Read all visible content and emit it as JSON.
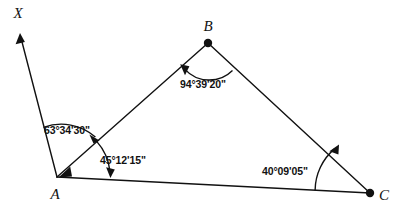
{
  "figure": {
    "type": "geometry-diagram",
    "shape": "triangle-with-ray",
    "background_color": "#ffffff",
    "stroke_color": "#111111",
    "vertices": [
      {
        "id": "A",
        "label": "A",
        "x": 57,
        "y": 177,
        "dot": false,
        "label_x": 55,
        "label_y": 199
      },
      {
        "id": "B",
        "label": "B",
        "x": 208,
        "y": 43,
        "dot": true,
        "label_x": 208,
        "label_y": 31
      },
      {
        "id": "C",
        "label": "C",
        "x": 370,
        "y": 193,
        "dot": true,
        "label_x": 384,
        "label_y": 200
      },
      {
        "id": "X",
        "label": "X",
        "x": 20,
        "y": 38,
        "dot": false,
        "label_x": 18,
        "label_y": 18
      }
    ],
    "segments": [
      {
        "name": "ray-A-X",
        "from": "A",
        "to": "X",
        "arrow_at_end": true
      },
      {
        "name": "side-A-B",
        "from": "A",
        "to": "B",
        "arrow_at_end": false
      },
      {
        "name": "side-B-C",
        "from": "B",
        "to": "C",
        "arrow_at_end": false
      },
      {
        "name": "side-A-C",
        "from": "A",
        "to": "C",
        "arrow_at_end": false
      }
    ],
    "angles": [
      {
        "id": "angle-XAB",
        "vertex": "A",
        "value": "63°34'30\"",
        "label_x": 44,
        "label_y": 134,
        "arc_radius": 52,
        "arrow": "at-end"
      },
      {
        "id": "angle-BAC",
        "vertex": "A",
        "value": "45°12'15\"",
        "label_x": 100,
        "label_y": 164,
        "arc_radius": 53,
        "arrow": "at-end"
      },
      {
        "id": "angle-ABC",
        "vertex": "B",
        "value": "94°39'20\"",
        "label_x": 180,
        "label_y": 88,
        "arc_radius": 33,
        "arrow": "at-end"
      },
      {
        "id": "angle-BCA",
        "vertex": "C",
        "value": "40°09'05\"",
        "label_x": 262,
        "label_y": 175,
        "arc_radius": 55,
        "arrow": "at-end"
      }
    ]
  }
}
